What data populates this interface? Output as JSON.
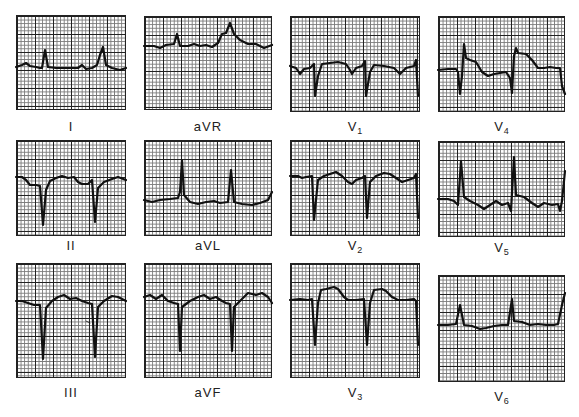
{
  "figure": {
    "type": "12-lead electrocardiogram",
    "layout": "3 rows x 4 columns",
    "background": "#ffffff",
    "grid_color": "#222222",
    "trace_color": "#111111"
  },
  "leads": [
    {
      "id": "I",
      "label": "I",
      "sub": "",
      "column": 1,
      "row": 1
    },
    {
      "id": "II",
      "label": "II",
      "sub": "",
      "column": 1,
      "row": 2
    },
    {
      "id": "III",
      "label": "III",
      "sub": "",
      "column": 1,
      "row": 3
    },
    {
      "id": "aVR",
      "label": "aVR",
      "sub": "",
      "column": 2,
      "row": 1
    },
    {
      "id": "aVL",
      "label": "aVL",
      "sub": "",
      "column": 2,
      "row": 2
    },
    {
      "id": "aVF",
      "label": "aVF",
      "sub": "",
      "column": 2,
      "row": 3
    },
    {
      "id": "V1",
      "label": "V",
      "sub": "1",
      "column": 3,
      "row": 1
    },
    {
      "id": "V2",
      "label": "V",
      "sub": "2",
      "column": 3,
      "row": 2
    },
    {
      "id": "V3",
      "label": "V",
      "sub": "3",
      "column": 3,
      "row": 3
    },
    {
      "id": "V4",
      "label": "V",
      "sub": "4",
      "column": 4,
      "row": 1
    },
    {
      "id": "V5",
      "label": "V",
      "sub": "5",
      "column": 4,
      "row": 2
    },
    {
      "id": "V6",
      "label": "V",
      "sub": "6",
      "column": 4,
      "row": 3
    }
  ]
}
